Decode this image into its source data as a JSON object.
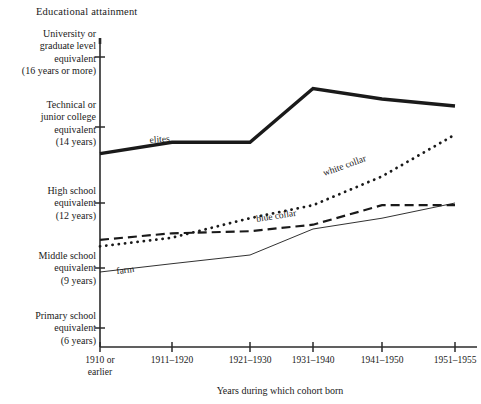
{
  "chart_data": {
    "type": "line",
    "title": "Educational attainment",
    "xlabel": "Years during which cohort born",
    "ylabel": "Educational attainment",
    "grid": false,
    "legend_position": "inline-labels",
    "categories": [
      "1910 or earlier",
      "1911–1920",
      "1921–1930",
      "1931–1940",
      "1941–1950",
      "1951–1955"
    ],
    "ytick_labels": [
      "University or graduate level equivalent (16 years or more)",
      "Technical or junior college equivalent (14 years)",
      "High school equivalent (12 years)",
      "Middle school equivalent (9 years)",
      "Primary school equivalent (6 years)"
    ],
    "ytick_values": [
      16,
      14,
      12,
      9,
      6
    ],
    "ylim": [
      5.0,
      16.8
    ],
    "series": [
      {
        "name": "elites",
        "style": "thick-solid",
        "values": [
          13.3,
          13.6,
          13.6,
          15.1,
          14.8,
          14.6
        ]
      },
      {
        "name": "white collar",
        "style": "dotted",
        "values": [
          10.0,
          10.4,
          11.3,
          11.9,
          12.7,
          13.8
        ]
      },
      {
        "name": "blue collar",
        "style": "dashed",
        "values": [
          10.3,
          10.6,
          10.7,
          11.0,
          11.9,
          11.9
        ]
      },
      {
        "name": "farm",
        "style": "thin-solid",
        "values": [
          8.8,
          9.2,
          9.6,
          10.8,
          11.3,
          12.0
        ]
      }
    ]
  },
  "axes": {
    "y_ticks": [
      {
        "line1": "University or",
        "line2": "graduate level",
        "line3": "equivalent",
        "line4": "(16 years or more)"
      },
      {
        "line1": "Technical or",
        "line2": "junior college",
        "line3": "equivalent",
        "line4": "(14 years)"
      },
      {
        "line1": "High school",
        "line2": "equivalent",
        "line3": "(12 years)",
        "line4": ""
      },
      {
        "line1": "Middle school",
        "line2": "equivalent",
        "line3": "(9 years)",
        "line4": ""
      },
      {
        "line1": "Primary school",
        "line2": "equivalent",
        "line3": "(6 years)",
        "line4": ""
      }
    ],
    "x_ticks": [
      {
        "line1": "1910 or",
        "line2": "earlier"
      },
      {
        "line1": "1911–1920",
        "line2": ""
      },
      {
        "line1": "1921–1930",
        "line2": ""
      },
      {
        "line1": "1931–1940",
        "line2": ""
      },
      {
        "line1": "1941–1950",
        "line2": ""
      },
      {
        "line1": "1951–1955",
        "line2": ""
      }
    ],
    "x_axis_title": "Years during which cohort born"
  },
  "series_labels": {
    "elites": "elites",
    "white_collar": "white collar",
    "blue_collar": "blue collar",
    "farm": "farm"
  },
  "colors": {
    "ink": "#1a1a1a",
    "axis": "#2b2b2b",
    "background": "#ffffff"
  }
}
